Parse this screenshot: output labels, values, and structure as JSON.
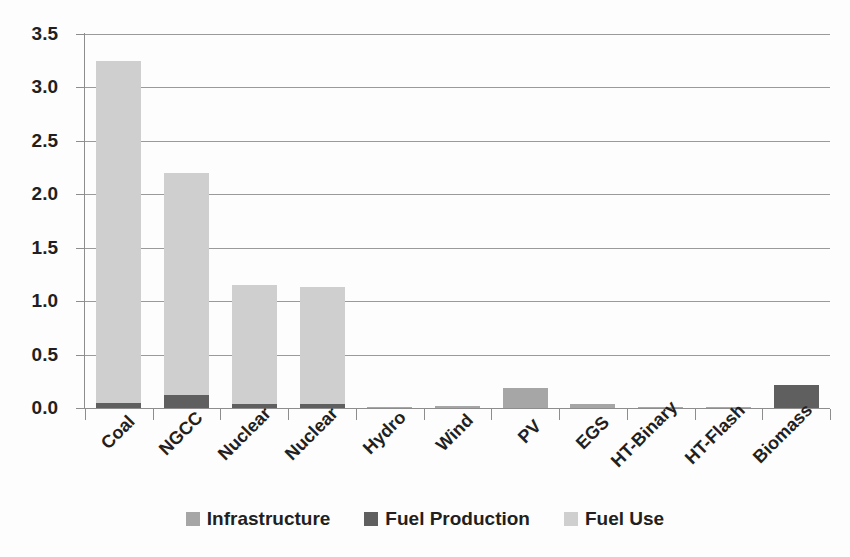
{
  "chart_data": {
    "type": "bar",
    "stacked": true,
    "title": "",
    "subtitle": "",
    "xlabel": "",
    "ylabel": "",
    "ylim": [
      0.0,
      3.5
    ],
    "ytick_labels": [
      "0.0",
      "0.5",
      "1.0",
      "1.5",
      "2.0",
      "2.5",
      "3.0",
      "3.5"
    ],
    "ytick_values": [
      0.0,
      0.5,
      1.0,
      1.5,
      2.0,
      2.5,
      3.0,
      3.5
    ],
    "grid": true,
    "legend_position": "bottom",
    "categories": [
      "Coal",
      "NGCC",
      "Nuclear",
      "Nuclear",
      "Hydro",
      "Wind",
      "PV",
      "EGS",
      "HT-Binary",
      "HT-Flash",
      "Biomass"
    ],
    "series": [
      {
        "name": "Infrastructure",
        "color": "#a6a6a6",
        "values": [
          0.0,
          0.0,
          0.0,
          0.0,
          0.008,
          0.015,
          0.19,
          0.04,
          0.013,
          0.008,
          0.0
        ]
      },
      {
        "name": "Fuel Production",
        "color": "#5f5f5f",
        "values": [
          0.05,
          0.12,
          0.035,
          0.035,
          0.0,
          0.0,
          0.0,
          0.0,
          0.0,
          0.0,
          0.22
        ]
      },
      {
        "name": "Fuel Use",
        "color": "#cfcfcf",
        "values": [
          3.2,
          2.08,
          1.115,
          1.1,
          0.0,
          0.0,
          0.0,
          0.0,
          0.0,
          0.0,
          0.0
        ]
      }
    ],
    "totals": [
      3.25,
      2.2,
      1.15,
      1.14,
      0.008,
      0.015,
      0.19,
      0.04,
      0.013,
      0.008,
      0.22
    ]
  },
  "legend": {
    "items": [
      {
        "label": "Infrastructure",
        "color": "#a6a6a6"
      },
      {
        "label": "Fuel Production",
        "color": "#5f5f5f"
      },
      {
        "label": "Fuel Use",
        "color": "#cfcfcf"
      }
    ]
  },
  "colors": {
    "infrastructure": "#a6a6a6",
    "fuel_production": "#5f5f5f",
    "fuel_use": "#cfcfcf",
    "gridline": "#9a9a9a",
    "axis": "#8d8d8d",
    "text": "#231f20",
    "background": "#fdfdfd"
  }
}
